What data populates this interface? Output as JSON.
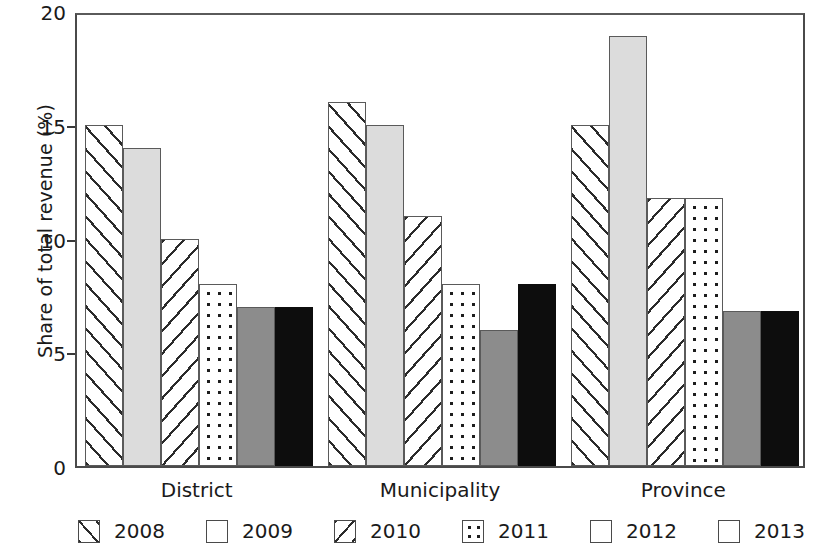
{
  "chart_data": {
    "type": "bar",
    "title": "",
    "xlabel": "",
    "ylabel": "Share of total revenue (%)",
    "ylim": [
      0,
      20
    ],
    "yticks": [
      0,
      5,
      10,
      15,
      20
    ],
    "ytick_labels": [
      "0",
      "5",
      "10",
      "15",
      "20"
    ],
    "grid": false,
    "legend_position": "bottom",
    "categories": [
      "District",
      "Municipality",
      "Province"
    ],
    "series": [
      {
        "name": "2008",
        "pattern": "forward-diagonal-hatch",
        "color": "#ffffff",
        "values": [
          15.0,
          16.0,
          15.0
        ]
      },
      {
        "name": "2009",
        "pattern": "solid-light-gray",
        "color": "#dcdcdc",
        "values": [
          14.0,
          15.0,
          18.9
        ]
      },
      {
        "name": "2010",
        "pattern": "backward-diagonal-hatch",
        "color": "#ffffff",
        "values": [
          10.0,
          11.0,
          11.8
        ]
      },
      {
        "name": "2011",
        "pattern": "dotted",
        "color": "#ffffff",
        "values": [
          8.0,
          8.0,
          11.8
        ]
      },
      {
        "name": "2012",
        "pattern": "solid-medium-gray",
        "color": "#8c8c8c",
        "values": [
          7.0,
          6.0,
          6.8
        ]
      },
      {
        "name": "2013",
        "pattern": "solid-black",
        "color": "#0d0d0d",
        "values": [
          7.0,
          8.0,
          6.8
        ]
      }
    ]
  }
}
